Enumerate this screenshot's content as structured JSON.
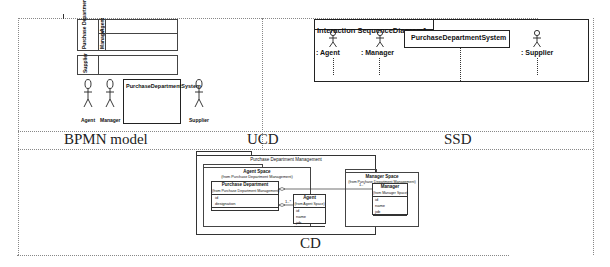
{
  "panels": {
    "bpmn": {
      "caption": "BPMN model",
      "lanes": [
        {
          "pool": "Purchase Department",
          "sublanes": [
            "Agent",
            "Manager"
          ]
        },
        {
          "pool": "Supplier",
          "sublanes": []
        }
      ],
      "actors": [
        "Agent",
        "Manager",
        "Supplier"
      ],
      "system_box": "PurchaseDepartmentSystem"
    },
    "ucd": {
      "caption": "UCD"
    },
    "ssd": {
      "caption": "SSD",
      "frame_title": "Interaction SequenceDiagram1",
      "lifelines": [
        ": Agent",
        ": Manager",
        "PurchaseDepartmentSystem",
        ": Supplier"
      ]
    },
    "cd": {
      "caption": "CD",
      "package": "Purchase Department Management",
      "agent_space": {
        "title": "Agent Space",
        "subtitle": "(from Purchase Department Management)",
        "purchase_department": {
          "name": "Purchase Department",
          "from": "(from Purchase Department Management)",
          "attributes": [
            "id",
            "designation"
          ]
        },
        "agent": {
          "name": "Agent",
          "from": "(from Agent Space)",
          "attributes": [
            "id",
            "name",
            "job"
          ],
          "multiplicity": "1..*"
        }
      },
      "manager_space": {
        "title": "Manager Space",
        "subtitle": "(from Purchase Department Management)",
        "manager": {
          "name": "Manager",
          "from": "(from Manager Space)",
          "attributes": [
            "id",
            "name",
            "job"
          ],
          "multiplicity": "1..*"
        }
      }
    }
  }
}
